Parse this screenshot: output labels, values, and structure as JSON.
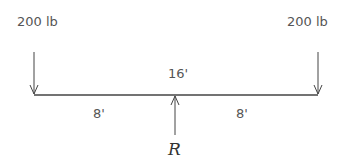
{
  "diagram": {
    "loads": [
      {
        "label": "200 lb",
        "position": "left end"
      },
      {
        "label": "200 lb",
        "position": "right end"
      }
    ],
    "total_length_label": "16'",
    "segments": [
      {
        "label": "8'"
      },
      {
        "label": "8'"
      }
    ],
    "reaction_label": "R",
    "colors": {
      "line": "#444444",
      "text": "#555555"
    }
  }
}
